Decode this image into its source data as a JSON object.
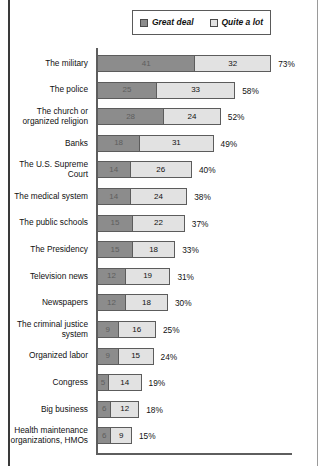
{
  "legend": {
    "entries": [
      {
        "label": "Great deal",
        "color": "#8c8c8c",
        "icon": "square-swatch-icon"
      },
      {
        "label": "Quite a lot",
        "color": "#e2e2e2",
        "icon": "square-swatch-icon"
      }
    ]
  },
  "chart_data": {
    "type": "bar",
    "orientation": "horizontal",
    "stacked": true,
    "title": "",
    "subtitle": "",
    "xlabel": "",
    "ylabel": "",
    "xlim": [
      0,
      80
    ],
    "grid": false,
    "legend_position": "top-center",
    "value_suffix": "%",
    "categories": [
      "The military",
      "The police",
      "The church or organized religion",
      "Banks",
      "The U.S. Supreme Court",
      "The medical system",
      "The public schools",
      "The Presidency",
      "Television news",
      "Newspapers",
      "The criminal justice system",
      "Organized labor",
      "Congress",
      "Big business",
      "Health maintenance organizations, HMOs"
    ],
    "series": [
      {
        "name": "Great deal",
        "color": "#8c8c8c",
        "values": [
          41,
          25,
          28,
          18,
          14,
          14,
          15,
          15,
          12,
          12,
          9,
          9,
          5,
          6,
          6
        ]
      },
      {
        "name": "Quite a lot",
        "color": "#e2e2e2",
        "values": [
          32,
          33,
          24,
          31,
          26,
          24,
          22,
          18,
          19,
          18,
          16,
          15,
          14,
          12,
          9
        ]
      }
    ],
    "totals": [
      73,
      58,
      52,
      49,
      40,
      38,
      37,
      33,
      31,
      30,
      25,
      24,
      19,
      18,
      15
    ],
    "total_labels": [
      "73%",
      "58%",
      "52%",
      "49%",
      "40%",
      "38%",
      "37%",
      "33%",
      "31%",
      "30%",
      "25%",
      "24%",
      "19%",
      "18%",
      "15%"
    ]
  }
}
